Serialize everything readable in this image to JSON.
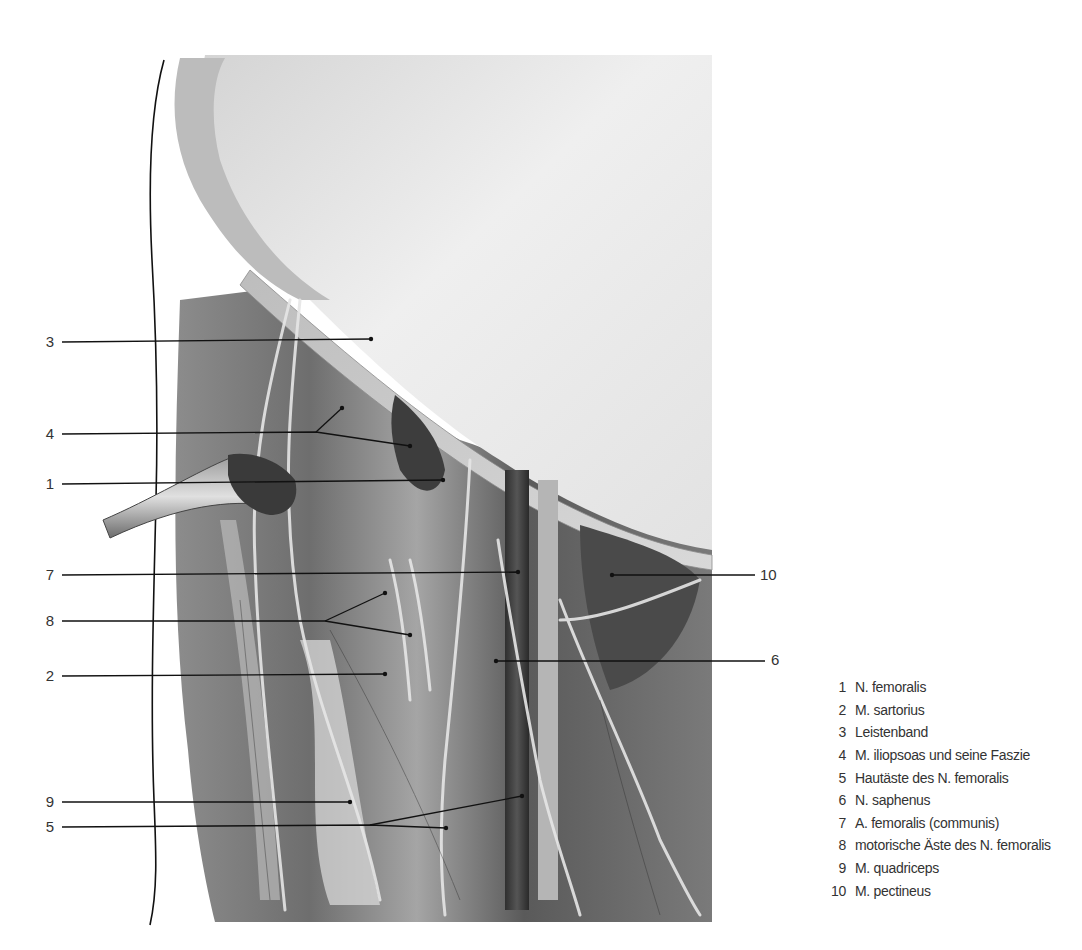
{
  "figure": {
    "colors": {
      "background": "#ffffff",
      "ink": "#1a1a1a",
      "label_text": "#333333",
      "skin_outline": "#111111"
    }
  },
  "callouts": [
    {
      "num": "1",
      "side": "left",
      "label_x": 40,
      "label_y": 476,
      "line": [
        [
          62,
          484
        ],
        [
          443,
          480
        ]
      ]
    },
    {
      "num": "2",
      "side": "left",
      "label_x": 40,
      "label_y": 668,
      "line": [
        [
          62,
          676
        ],
        [
          385,
          674
        ]
      ]
    },
    {
      "num": "3",
      "side": "left",
      "label_x": 40,
      "label_y": 334,
      "line": [
        [
          62,
          342
        ],
        [
          371,
          339
        ]
      ]
    },
    {
      "num": "4",
      "side": "left",
      "label_x": 40,
      "label_y": 426,
      "line": [
        [
          62,
          434
        ],
        [
          316,
          432
        ],
        [
          410,
          446
        ]
      ],
      "branch": [
        [
          316,
          432
        ],
        [
          342,
          408
        ]
      ]
    },
    {
      "num": "5",
      "side": "left",
      "label_x": 40,
      "label_y": 819,
      "line": [
        [
          62,
          827
        ],
        [
          370,
          825
        ],
        [
          446,
          828
        ]
      ],
      "branch": [
        [
          370,
          825
        ],
        [
          522,
          796
        ]
      ]
    },
    {
      "num": "6",
      "side": "right",
      "label_x": 770,
      "label_y": 652,
      "line": [
        [
          496,
          661
        ],
        [
          765,
          661
        ]
      ]
    },
    {
      "num": "7",
      "side": "left",
      "label_x": 40,
      "label_y": 567,
      "line": [
        [
          62,
          575
        ],
        [
          518,
          572
        ]
      ]
    },
    {
      "num": "8",
      "side": "left",
      "label_x": 40,
      "label_y": 613,
      "line": [
        [
          62,
          621
        ],
        [
          325,
          621
        ],
        [
          410,
          635
        ]
      ],
      "branch": [
        [
          325,
          621
        ],
        [
          385,
          593
        ]
      ]
    },
    {
      "num": "9",
      "side": "left",
      "label_x": 40,
      "label_y": 794,
      "line": [
        [
          62,
          802
        ],
        [
          350,
          802
        ]
      ]
    },
    {
      "num": "10",
      "side": "right",
      "label_x": 760,
      "label_y": 567,
      "line": [
        [
          612,
          575
        ],
        [
          755,
          575
        ]
      ]
    }
  ],
  "legend": {
    "items": [
      {
        "num": "1",
        "text": "N. femoralis"
      },
      {
        "num": "2",
        "text": "M. sartorius"
      },
      {
        "num": "3",
        "text": "Leistenband"
      },
      {
        "num": "4",
        "text": "M. iliopsoas und seine Faszie"
      },
      {
        "num": "5",
        "text": "Hautäste des N. femoralis"
      },
      {
        "num": "6",
        "text": "N. saphenus"
      },
      {
        "num": "7",
        "text": "A. femoralis (communis)"
      },
      {
        "num": "8",
        "text": "motorische Äste des N. femoralis"
      },
      {
        "num": "9",
        "text": "M. quadriceps"
      },
      {
        "num": "10",
        "text": "M. pectineus"
      }
    ]
  }
}
